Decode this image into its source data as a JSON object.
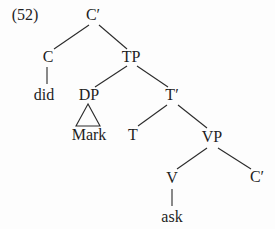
{
  "figure": {
    "example_number": "(52)",
    "description_colors": {
      "ink": "#1e1e1e",
      "background": "#fdfdfd"
    }
  },
  "tree": {
    "nodes": [
      {
        "id": "cbar-root",
        "label": "C′"
      },
      {
        "id": "c",
        "label": "C"
      },
      {
        "id": "tp",
        "label": "TP"
      },
      {
        "id": "did",
        "label": "did"
      },
      {
        "id": "dp",
        "label": "DP"
      },
      {
        "id": "tbar",
        "label": "T′"
      },
      {
        "id": "mark",
        "label": "Mark"
      },
      {
        "id": "t",
        "label": "T"
      },
      {
        "id": "vp",
        "label": "VP"
      },
      {
        "id": "v",
        "label": "V"
      },
      {
        "id": "cbar-lower",
        "label": "C′"
      },
      {
        "id": "ask",
        "label": "ask"
      }
    ]
  }
}
